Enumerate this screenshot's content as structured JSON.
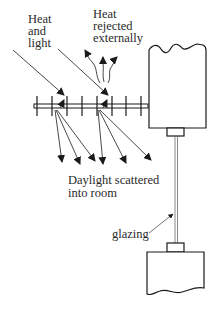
{
  "diagram": {
    "type": "light-shelf / louvre section",
    "labels": {
      "heat_and_light": [
        "Heat",
        "and",
        "light"
      ],
      "heat_rejected": [
        "Heat",
        "rejected",
        "externally"
      ],
      "daylight_scattered": [
        "Daylight scattered",
        "into room"
      ],
      "glazing": "glazing"
    },
    "colors": {
      "line": "#1a1a1a",
      "text": "#2a2a2a",
      "background": "#ffffff"
    }
  }
}
